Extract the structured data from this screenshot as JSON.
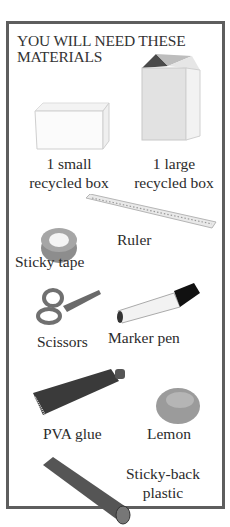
{
  "title": "YOU WILL NEED THESE MATERIALS",
  "materials": [
    {
      "id": "small-box",
      "label_line1": "1 small",
      "label_line2": "recycled box",
      "icon": "small-box-icon"
    },
    {
      "id": "large-box",
      "label_line1": "1 large",
      "label_line2": "recycled box",
      "icon": "large-box-icon"
    },
    {
      "id": "ruler",
      "label": "Ruler",
      "icon": "ruler-icon"
    },
    {
      "id": "sticky-tape",
      "label": "Sticky tape",
      "icon": "tape-icon"
    },
    {
      "id": "scissors",
      "label": "Scissors",
      "icon": "scissors-icon"
    },
    {
      "id": "marker-pen",
      "label": "Marker pen",
      "icon": "marker-pen-icon"
    },
    {
      "id": "pva-glue",
      "label": "PVA glue",
      "icon": "glue-tube-icon"
    },
    {
      "id": "lemon",
      "label": "Lemon",
      "icon": "lemon-icon"
    },
    {
      "id": "sticky-back-plastic",
      "label_line1": "Sticky-back",
      "label_line2": "plastic",
      "icon": "plastic-roll-icon"
    }
  ],
  "colors": {
    "border": "#5e5e5e",
    "text": "#2b2b2b"
  }
}
